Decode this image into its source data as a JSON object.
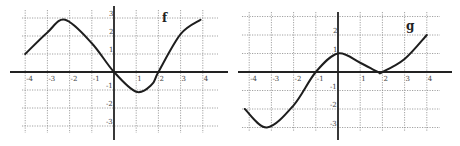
{
  "chart_data": [
    {
      "type": "line",
      "title": "f",
      "xlabel": "",
      "ylabel": "",
      "xlim": [
        -4,
        4
      ],
      "ylim": [
        -3,
        3
      ],
      "grid": true,
      "x_ticks": [
        "-4",
        "-3",
        "-2",
        "-1",
        "1",
        "2",
        "3",
        "4"
      ],
      "y_ticks": [
        "3",
        "2",
        "1",
        "-1",
        "-2",
        "-3"
      ],
      "series": [
        {
          "name": "f",
          "x": [
            -4,
            -3,
            -2.2,
            -1,
            0,
            1,
            1.7,
            2,
            3,
            3.9
          ],
          "y": [
            1,
            2.2,
            2.9,
            1.6,
            0,
            -1.1,
            -0.7,
            0,
            2.1,
            2.9
          ]
        }
      ]
    },
    {
      "type": "line",
      "title": "g",
      "xlabel": "",
      "ylabel": "",
      "xlim": [
        -4,
        4
      ],
      "ylim": [
        -3,
        3
      ],
      "grid": true,
      "x_ticks": [
        "-4",
        "-3",
        "-2",
        "-1",
        "1",
        "2",
        "3",
        "4"
      ],
      "y_ticks": [
        "2",
        "1",
        "-1",
        "-2",
        "-3"
      ],
      "series": [
        {
          "name": "g",
          "x": [
            -4.2,
            -3.2,
            -2,
            -1,
            0,
            1,
            1.8,
            2,
            3,
            4
          ],
          "y": [
            -2,
            -3,
            -1.8,
            0,
            1,
            0.5,
            0,
            0,
            0.7,
            2
          ]
        }
      ]
    }
  ],
  "graphs": {
    "f": {
      "label": "f"
    },
    "g": {
      "label": "g"
    }
  }
}
